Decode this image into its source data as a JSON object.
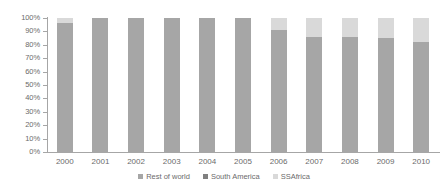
{
  "chart_data": {
    "type": "bar",
    "subtype": "100%-stacked-column",
    "title": "",
    "subtitle": "",
    "xlabel": "",
    "ylabel": "",
    "categories": [
      "2000",
      "2001",
      "2002",
      "2003",
      "2004",
      "2005",
      "2006",
      "2007",
      "2008",
      "2009",
      "2010"
    ],
    "series": [
      {
        "name": "Rest of world",
        "color": "#a6a6a6",
        "values": [
          96,
          100,
          100,
          100,
          100,
          100,
          91,
          86,
          86,
          85,
          82
        ]
      },
      {
        "name": "South America",
        "color": "#808080",
        "values": [
          0,
          0,
          0,
          0,
          0,
          0,
          0,
          0,
          0,
          0,
          0
        ]
      },
      {
        "name": "SSAfrica",
        "color": "#d9d9d9",
        "values": [
          4,
          0,
          0,
          0,
          0,
          0,
          9,
          14,
          14,
          15,
          18
        ]
      }
    ],
    "ylim": [
      0,
      100
    ],
    "ytick_values": [
      0,
      10,
      20,
      30,
      40,
      50,
      60,
      70,
      80,
      90,
      100
    ],
    "ytick_labels": [
      "0%",
      "10%",
      "20%",
      "30%",
      "40%",
      "50%",
      "60%",
      "70%",
      "80%",
      "90%",
      "100%"
    ],
    "grid": false,
    "legend_position": "bottom",
    "legend_entries": [
      {
        "label": "Rest of world",
        "color": "#a6a6a6",
        "marker": "square"
      },
      {
        "label": "South America",
        "color": "#808080",
        "marker": "square"
      },
      {
        "label": "SSAfrica",
        "color": "#d9d9d9",
        "marker": "square"
      }
    ],
    "axis_color": "#a6a6a6",
    "text_color": "#6b6b6b",
    "background": "#ffffff"
  }
}
